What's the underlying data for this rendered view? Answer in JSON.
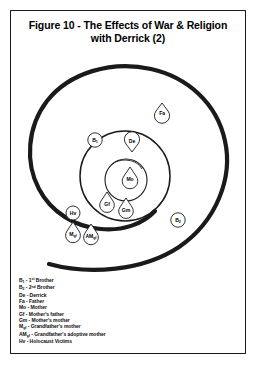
{
  "figure": {
    "title_line1": "Figure 10 - The Effects of War & Religion",
    "title_line2": "with Derrick (2)"
  },
  "diagram": {
    "type": "spiral-concentric-node-map",
    "stroke_color": "#1a1a1a",
    "nodes": [
      {
        "id": "Fa",
        "label": "Fa",
        "label_sub": "",
        "x": 151,
        "y": 62,
        "shape": "teardrop",
        "ring": "outside"
      },
      {
        "id": "B1",
        "label": "B",
        "label_sub": "1",
        "x": 84,
        "y": 91,
        "shape": "teardrop",
        "ring": "outer"
      },
      {
        "id": "De",
        "label": "De",
        "label_sub": "",
        "x": 121,
        "y": 92,
        "shape": "teardrop",
        "ring": "mid"
      },
      {
        "id": "Mo",
        "label": "Mo",
        "label_sub": "",
        "x": 119,
        "y": 127,
        "shape": "teardrop",
        "ring": "inner"
      },
      {
        "id": "Gf",
        "label": "Gf",
        "label_sub": "",
        "x": 96,
        "y": 152,
        "shape": "teardrop",
        "ring": "mid"
      },
      {
        "id": "Gm",
        "label": "Gm",
        "label_sub": "",
        "x": 115,
        "y": 158,
        "shape": "teardrop",
        "ring": "mid"
      },
      {
        "id": "Hv",
        "label": "Hv",
        "label_sub": "",
        "x": 62,
        "y": 164,
        "shape": "teardrop",
        "ring": "outer"
      },
      {
        "id": "Mgf",
        "label": "M",
        "label_sub": "gf",
        "x": 62,
        "y": 182,
        "shape": "teardrop",
        "ring": "outside"
      },
      {
        "id": "AMgf",
        "label": "AM",
        "label_sub": "gf",
        "x": 80,
        "y": 184,
        "shape": "teardrop",
        "ring": "outside"
      },
      {
        "id": "B2",
        "label": "B",
        "label_sub": "2",
        "x": 167,
        "y": 171,
        "shape": "teardrop",
        "ring": "outside"
      }
    ]
  },
  "legend": {
    "items": [
      {
        "key": "B",
        "key_sub": "1",
        "key_sup": "",
        "dash": " - ",
        "desc_pre": "1",
        "desc_sup": "st",
        "desc": " Brother"
      },
      {
        "key": "B",
        "key_sub": "2",
        "key_sup": "",
        "dash": " - ",
        "desc_pre": "2",
        "desc_sup": "nd",
        "desc": " Brother"
      },
      {
        "key": "De",
        "key_sub": "",
        "key_sup": "",
        "dash": " - ",
        "desc_pre": "",
        "desc_sup": "",
        "desc": "Derrick"
      },
      {
        "key": "Fa",
        "key_sub": "",
        "key_sup": "",
        "dash": " - ",
        "desc_pre": "",
        "desc_sup": "",
        "desc": "Father"
      },
      {
        "key": "Mo",
        "key_sub": "",
        "key_sup": "",
        "dash": " - ",
        "desc_pre": "",
        "desc_sup": "",
        "desc": "Mother"
      },
      {
        "key": "Gf",
        "key_sub": "",
        "key_sup": "",
        "dash": " - ",
        "desc_pre": "",
        "desc_sup": "",
        "desc": "Mother's father"
      },
      {
        "key": "Gm",
        "key_sub": "",
        "key_sup": "",
        "dash": " - ",
        "desc_pre": "",
        "desc_sup": "",
        "desc": "Mother's mother"
      },
      {
        "key": "M",
        "key_sub": "gf",
        "key_sup": "",
        "dash": " - ",
        "desc_pre": "",
        "desc_sup": "",
        "desc": "Grandfather's mother"
      },
      {
        "key": "AM",
        "key_sub": "gf",
        "key_sup": "",
        "dash": " - ",
        "desc_pre": "",
        "desc_sup": "",
        "desc": "Grandfather's adoptive mother"
      },
      {
        "key": "Hv",
        "key_sub": "",
        "key_sup": "",
        "dash": " - ",
        "desc_pre": "",
        "desc_sup": "",
        "desc": "Holocaust Victims"
      }
    ]
  }
}
